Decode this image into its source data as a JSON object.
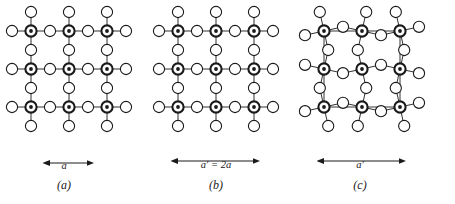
{
  "figure": {
    "type": "crystal-lattice-diagram",
    "background_color": "#ffffff",
    "line_color": "#1a1a1a",
    "cell_outline_color": "#9a9a9a",
    "panel_count": 3
  },
  "panels": [
    {
      "id": "a",
      "caption": "(a)",
      "dimension_label": "a",
      "description": "undistorted square perovskite-type lattice, unit cell edge a",
      "arrow_span_px": 38,
      "distorted": false,
      "cell_outline": false
    },
    {
      "id": "b",
      "caption": "(b)",
      "dimension_label": "a′ = 2a",
      "description": "same undistorted lattice with doubled unit cell a prime equals two a",
      "arrow_span_px": 76,
      "distorted": false,
      "cell_outline": false
    },
    {
      "id": "c",
      "caption": "(c)",
      "dimension_label": "a′",
      "description": "distorted lattice with rotated anion octahedra, enlarged cell a prime outlined",
      "arrow_span_px": 76,
      "distorted": true,
      "cell_outline": true
    }
  ],
  "lattice": {
    "cation_symbol": "filled-dot-circle",
    "anion_symbol": "open-circle",
    "cation_rows": 3,
    "cation_cols": 3,
    "spacing_px": 38,
    "cation_radius_px": 5.6,
    "cation_dot_radius_px": 1.9,
    "anion_radius_px": 5.6,
    "distortion_offset_px": 4.2
  }
}
